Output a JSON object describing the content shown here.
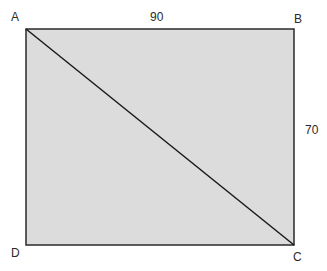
{
  "diagram": {
    "type": "rectangle-with-diagonal",
    "fill_color": "#dcdcdc",
    "stroke_color": "#2a2a2a",
    "vertices": {
      "A": {
        "label": "A"
      },
      "B": {
        "label": "B"
      },
      "C": {
        "label": "C"
      },
      "D": {
        "label": "D"
      }
    },
    "dimensions": {
      "top": "90",
      "right": "70"
    },
    "diagonal": "AC"
  }
}
